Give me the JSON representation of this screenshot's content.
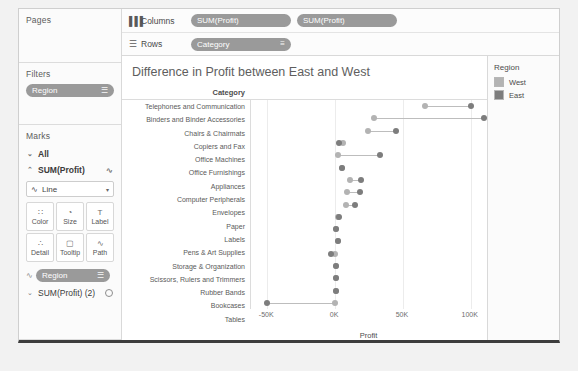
{
  "sidebar": {
    "pages": {
      "title": "Pages"
    },
    "filters": {
      "title": "Filters",
      "pill": "Region",
      "pill_icon": "filter-icon"
    },
    "marks": {
      "title": "Marks",
      "all_label": "All",
      "all_chevron": "⌄",
      "measure_label": "SUM(Profit)",
      "measure_chevron": "⌃",
      "measure_icon": "line-mark-icon",
      "mark_type": "Line",
      "mark_type_icon": "line-icon",
      "caret": "▾",
      "properties": [
        {
          "label": "Color",
          "icon": "color-icon",
          "glyph": "∷"
        },
        {
          "label": "Size",
          "icon": "size-icon",
          "glyph": "◔"
        },
        {
          "label": "Label",
          "icon": "label-icon",
          "glyph": "T"
        },
        {
          "label": "Detail",
          "icon": "detail-icon",
          "glyph": "∴"
        },
        {
          "label": "Tooltip",
          "icon": "tooltip-icon",
          "glyph": "▢"
        },
        {
          "label": "Path",
          "icon": "path-icon",
          "glyph": "∿"
        }
      ],
      "on_mark_pill": "Region",
      "on_mark_lead_icon": "line-icon",
      "on_mark_pill_icon": "color-legend-icon",
      "second_measure": "SUM(Profit) (2)",
      "second_measure_chevron": "⌄",
      "second_measure_icon": "circle-mark-icon"
    }
  },
  "shelves": {
    "columns": {
      "label": "Columns",
      "icon": "columns-icon",
      "pills": [
        "SUM(Profit)",
        "SUM(Profit)"
      ]
    },
    "rows": {
      "label": "Rows",
      "icon": "rows-icon",
      "pills": [
        "Category"
      ],
      "sort_icon": "sort-icon"
    }
  },
  "legend": {
    "title": "Region",
    "items": [
      {
        "label": "West",
        "color": "#b3b3b3"
      },
      {
        "label": "East",
        "color": "#7d7d7d"
      }
    ]
  },
  "chart_data": {
    "type": "scatter",
    "title": "Difference in Profit between East and West",
    "xlabel": "Profit",
    "ylabel": "Category",
    "row_header": "Category",
    "xlim": [
      -62000,
      112000
    ],
    "xticks": [
      -50000,
      0,
      50000,
      100000
    ],
    "xticklabels": [
      "-50K",
      "0K",
      "50K",
      "100K"
    ],
    "grid": true,
    "legend_position": "right",
    "series": [
      {
        "name": "West",
        "color": "#b3b3b3"
      },
      {
        "name": "East",
        "color": "#7d7d7d"
      }
    ],
    "categories": [
      "Telephones and Communication",
      "Binders and Binder Accessories",
      "Chairs & Chairmats",
      "Copiers and Fax",
      "Office Machines",
      "Office Furnishings",
      "Appliances",
      "Computer Peripherals",
      "Envelopes",
      "Paper",
      "Labels",
      "Pens & Art Supplies",
      "Storage & Organization",
      "Scissors, Rulers and Trimmers",
      "Rubber Bands",
      "Bookcases",
      "Tables"
    ],
    "west_values": [
      66000,
      29000,
      24000,
      6000,
      2000,
      5000,
      11000,
      9000,
      8000,
      2000,
      1000,
      2000,
      0,
      1000,
      1000,
      500,
      0
    ],
    "east_values": [
      100000,
      110000,
      45000,
      3000,
      33000,
      5000,
      19000,
      18000,
      15000,
      3000,
      1000,
      2000,
      -3000,
      1000,
      1000,
      500,
      -50000
    ]
  }
}
